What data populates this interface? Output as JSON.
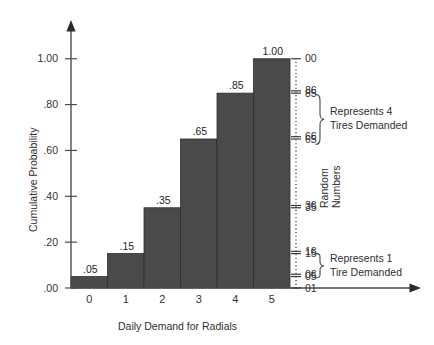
{
  "chart_data": {
    "type": "bar",
    "title": "",
    "subtitle": "",
    "xlabel": "Daily Demand for Radials",
    "ylabel": "Cumulative Probability",
    "categories": [
      "0",
      "1",
      "2",
      "3",
      "4",
      "5"
    ],
    "values": [
      0.05,
      0.15,
      0.35,
      0.65,
      0.85,
      1.0
    ],
    "bar_labels": [
      ".05",
      ".15",
      ".35",
      ".65",
      ".85",
      "1.00"
    ],
    "ylim": [
      0.0,
      1.0
    ],
    "yticks": [
      0.0,
      0.2,
      0.4,
      0.6,
      0.8,
      1.0
    ],
    "ytick_labels": [
      ".00",
      ".20",
      ".40",
      ".60",
      ".80",
      "1.00"
    ],
    "xlim": [
      -0.5,
      5.5
    ],
    "grid": false,
    "legend": null,
    "bar_color": "#4a4a4a",
    "bar_edge_color": "#2e2e2e",
    "axis_color": "#4d4d4d",
    "secondary_axis": {
      "label_line1": "Random",
      "label_line2": "Numbers",
      "style": "dotted",
      "ticks": [
        {
          "label": "00",
          "value": 1.0
        },
        {
          "label": "86",
          "value": 0.86
        },
        {
          "label": "85",
          "value": 0.85
        },
        {
          "label": "66",
          "value": 0.66
        },
        {
          "label": "65",
          "value": 0.65
        },
        {
          "label": "36",
          "value": 0.36
        },
        {
          "label": "35",
          "value": 0.35
        },
        {
          "label": "16",
          "value": 0.16
        },
        {
          "label": "15",
          "value": 0.15
        },
        {
          "label": "06",
          "value": 0.06
        },
        {
          "label": "05",
          "value": 0.05
        },
        {
          "label": "01",
          "value": 0.0
        }
      ]
    },
    "annotations": [
      {
        "name": "represents-4-tires",
        "line1": "Represents 4",
        "line2": "Tires Demanded",
        "range_low": 0.65,
        "range_high": 0.86
      },
      {
        "name": "represents-1-tire",
        "line1": "Represents 1",
        "line2": "Tire Demanded",
        "range_low": 0.06,
        "range_high": 0.16
      }
    ]
  }
}
